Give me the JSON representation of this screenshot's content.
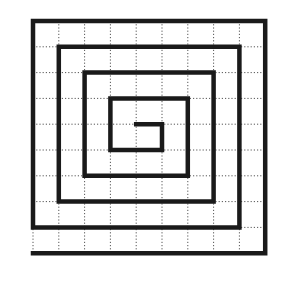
{
  "diagram": {
    "type": "square-spiral-on-grid",
    "grid": {
      "origin_x": 33,
      "origin_y": 21,
      "cell_size": 25.8,
      "cols": 9,
      "rows": 9,
      "line_color": "#555555",
      "line_style": "dotted"
    },
    "spiral": {
      "stroke_color": "#1a1a1a",
      "stroke_width": 4.5,
      "path_grid_points": [
        [
          0,
          9
        ],
        [
          9,
          9
        ],
        [
          9,
          0
        ],
        [
          0,
          0
        ],
        [
          0,
          8
        ],
        [
          8,
          8
        ],
        [
          8,
          1
        ],
        [
          1,
          1
        ],
        [
          1,
          7
        ],
        [
          7,
          7
        ],
        [
          7,
          2
        ],
        [
          2,
          2
        ],
        [
          2,
          6
        ],
        [
          6,
          6
        ],
        [
          6,
          3
        ],
        [
          3,
          3
        ],
        [
          3,
          5
        ],
        [
          5,
          5
        ],
        [
          5,
          4
        ],
        [
          4,
          4
        ]
      ]
    },
    "colors": {
      "background": "#ffffff",
      "spiral": "#1a1a1a",
      "grid": "#555555"
    }
  }
}
